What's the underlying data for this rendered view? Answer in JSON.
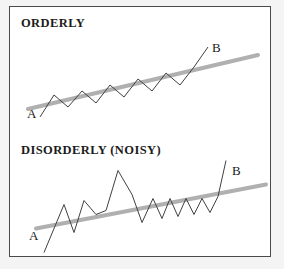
{
  "figure": {
    "background_color": "#f4f4f4",
    "panel_background": "#ffffff",
    "border_color": "#4a4a4a",
    "trend_color": "#b0b0b0",
    "series_color": "#404040"
  },
  "panels": {
    "orderly": {
      "title": "ORDERLY",
      "start_label": "A",
      "end_label": "B"
    },
    "disorderly": {
      "title": "DISORDERLY (NOISY)",
      "start_label": "A",
      "end_label": "B"
    }
  },
  "chart_data": [
    {
      "type": "line",
      "title": "ORDERLY",
      "xlabel": "",
      "ylabel": "",
      "grid": false,
      "legend": "none",
      "annotations": [
        {
          "text": "A",
          "x": 12,
          "y": 26,
          "role": "start-point"
        },
        {
          "text": "B",
          "x": 196,
          "y": 90,
          "role": "end-point"
        }
      ],
      "xlim": [
        0,
        262
      ],
      "ylim": [
        0,
        128
      ],
      "series": [
        {
          "name": "price-zigzag",
          "style": "thin-dark-zigzag",
          "color": "#404040",
          "x": [
            30,
            44,
            58,
            72,
            86,
            100,
            114,
            128,
            142,
            156,
            170,
            184,
            198
          ],
          "y": [
            18,
            40,
            28,
            44,
            32,
            50,
            38,
            56,
            44,
            62,
            50,
            68,
            88
          ]
        },
        {
          "name": "trend-line",
          "style": "thick-gray-straight",
          "color": "#b0b0b0",
          "x": [
            18,
            248
          ],
          "y": [
            26,
            80
          ]
        }
      ]
    },
    {
      "type": "line",
      "title": "DISORDERLY (NOISY)",
      "xlabel": "",
      "ylabel": "",
      "grid": false,
      "legend": "none",
      "annotations": [
        {
          "text": "A",
          "x": 34,
          "y": 8,
          "role": "start-point"
        },
        {
          "text": "B",
          "x": 212,
          "y": 92,
          "role": "end-point"
        }
      ],
      "xlim": [
        0,
        262
      ],
      "ylim": [
        0,
        123
      ],
      "series": [
        {
          "name": "price-zigzag",
          "style": "thin-dark-zigzag",
          "color": "#404040",
          "x": [
            34,
            54,
            64,
            74,
            86,
            96,
            108,
            122,
            132,
            143,
            152,
            160,
            168,
            176,
            184,
            192,
            200,
            208,
            216
          ],
          "y": [
            8,
            56,
            28,
            60,
            46,
            50,
            90,
            66,
            38,
            62,
            42,
            62,
            44,
            62,
            46,
            62,
            48,
            64,
            100
          ]
        },
        {
          "name": "trend-line",
          "style": "thick-gray-straight",
          "color": "#b0b0b0",
          "x": [
            26,
            256
          ],
          "y": [
            32,
            76
          ]
        }
      ]
    }
  ]
}
